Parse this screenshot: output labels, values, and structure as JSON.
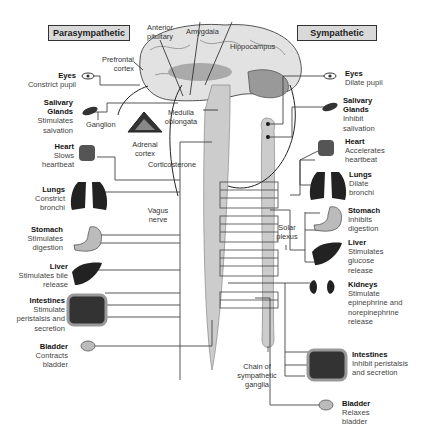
{
  "headers": {
    "left": "Parasympathetic",
    "right": "Sympathetic"
  },
  "brain_labels": {
    "anterior_pituitary": "Anterior pituitary",
    "amygdala": "Amygdala",
    "hippocampus": "Hippocampus",
    "prefrontal_cortex": "Prefrontal cortex",
    "medulla_oblongata": "Medulla oblongata",
    "ganglion": "Ganglion",
    "adrenal_cortex": "Adrenal cortex",
    "corticosterone": "Corticosterone",
    "vagus_nerve": "Vagus nerve",
    "solar_plexus": "Solar plexus",
    "chain": "Chain of sympathetic ganglia"
  },
  "parasympathetic": [
    {
      "organ": "Eyes",
      "effect": "Constrict pupil"
    },
    {
      "organ": "Salivary Glands",
      "effect": "Stimulates salvation"
    },
    {
      "organ": "Heart",
      "effect": "Slows heartbeat"
    },
    {
      "organ": "Lungs",
      "effect": "Constrict bronchi"
    },
    {
      "organ": "Stomach",
      "effect": "Stimulates digestion"
    },
    {
      "organ": "Liver",
      "effect": "Stimulates bile release"
    },
    {
      "organ": "Intestines",
      "effect": "Stimulate peristalsis and secretion"
    },
    {
      "organ": "Bladder",
      "effect": "Contracts bladder"
    }
  ],
  "sympathetic": [
    {
      "organ": "Eyes",
      "effect": "Dilate pupil"
    },
    {
      "organ": "Salivary Glands",
      "effect": "Inhibit salivation"
    },
    {
      "organ": "Heart",
      "effect": "Accelerates heartbeat"
    },
    {
      "organ": "Lungs",
      "effect": "Dilate bronchi"
    },
    {
      "organ": "Stomach",
      "effect": "Inhibits digestion"
    },
    {
      "organ": "Liver",
      "effect": "Stimulates glucose release"
    },
    {
      "organ": "Kidneys",
      "effect": "Stimulate epinephrine and norepinephrine release"
    },
    {
      "organ": "Intestines",
      "effect": "Inhibit peristalsis and secretion"
    },
    {
      "organ": "Bladder",
      "effect": "Relaxes bladder"
    }
  ]
}
